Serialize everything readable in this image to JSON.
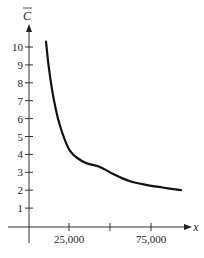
{
  "chart_data": {
    "type": "line",
    "title": "",
    "xlabel": "x",
    "ylabel": "C̄",
    "xlim": [
      0,
      100000
    ],
    "ylim": [
      0,
      11
    ],
    "grid": false,
    "x_ticks": [
      25000,
      50000,
      75000
    ],
    "x_tick_labels": [
      "25,000",
      "",
      "75,000"
    ],
    "y_ticks": [
      1,
      2,
      3,
      4,
      5,
      6,
      7,
      8,
      9,
      10
    ],
    "y_tick_labels": [
      "1",
      "2",
      "3",
      "4",
      "5",
      "6",
      "7",
      "8",
      "9",
      "10"
    ],
    "series": [
      {
        "name": "average cost",
        "color": "#111111",
        "x": [
          11000,
          12500,
          14500,
          17000,
          19500,
          22500,
          25600,
          30000,
          36000,
          43900,
          52000,
          62200,
          72000,
          82000,
          93300
        ],
        "y": [
          10.3,
          9.0,
          7.7,
          6.5,
          5.6,
          4.8,
          4.2,
          3.8,
          3.5,
          3.3,
          2.9,
          2.5,
          2.3,
          2.15,
          2.0
        ]
      }
    ]
  }
}
